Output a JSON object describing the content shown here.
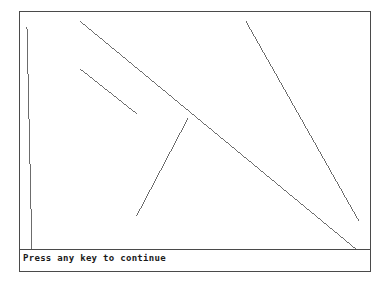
{
  "app": {
    "background_color": "#ffffff",
    "ink_color": "#6b6b6b",
    "border_color": "#4a4a4a",
    "text_color": "#1a1a1a"
  },
  "canvas": {
    "frame": {
      "x": 19,
      "y": 11,
      "width": 352,
      "height": 261
    },
    "viewbox": {
      "width": 352,
      "height": 261
    }
  },
  "status": {
    "prompt": "Press any key to continue"
  },
  "chart_data": {
    "type": "line",
    "title": "",
    "subtitle": "",
    "xlabel": "",
    "ylabel": "",
    "grid": false,
    "legend": null,
    "xlim": [
      0,
      352
    ],
    "ylim": [
      0,
      261
    ],
    "note": "Random straight line segments drawn on a bordered graphics canvas; coordinates are frame-relative pixels, y increases downward.",
    "series": [
      {
        "name": "line-1",
        "x": [
          7,
          12
        ],
        "y": [
          15,
          240
        ],
        "x1": 7,
        "y1": 15,
        "x2": 12,
        "y2": 240
      },
      {
        "name": "line-2",
        "x": [
          60,
          338
        ],
        "y": [
          9,
          239
        ],
        "x1": 60,
        "y1": 9,
        "x2": 338,
        "y2": 239
      },
      {
        "name": "line-3",
        "x": [
          60,
          118
        ],
        "y": [
          57,
          103
        ],
        "x1": 60,
        "y1": 57,
        "x2": 118,
        "y2": 103
      },
      {
        "name": "line-4",
        "x": [
          169,
          117
        ],
        "y": [
          107,
          206
        ],
        "x1": 169,
        "y1": 107,
        "x2": 117,
        "y2": 206
      },
      {
        "name": "line-5",
        "x": [
          227,
          341
        ],
        "y": [
          9,
          211
        ],
        "x1": 227,
        "y1": 9,
        "x2": 341,
        "y2": 211
      }
    ]
  }
}
